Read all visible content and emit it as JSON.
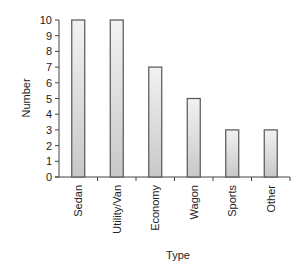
{
  "chart_data": {
    "type": "bar",
    "title": "",
    "xlabel": "Type",
    "ylabel": "Number",
    "categories": [
      "Sedan",
      "Utility/Van",
      "Economy",
      "Wagon",
      "Sports",
      "Other"
    ],
    "values": [
      10,
      10,
      7,
      5,
      3,
      3
    ],
    "ylim": [
      0,
      10
    ],
    "yticks": [
      0,
      1,
      2,
      3,
      4,
      5,
      6,
      7,
      8,
      9,
      10
    ],
    "grid": false,
    "legend": null,
    "bar_fill": "#d4d4d4",
    "bar_stroke": "#555555",
    "category_label_orientation": "vertical"
  }
}
